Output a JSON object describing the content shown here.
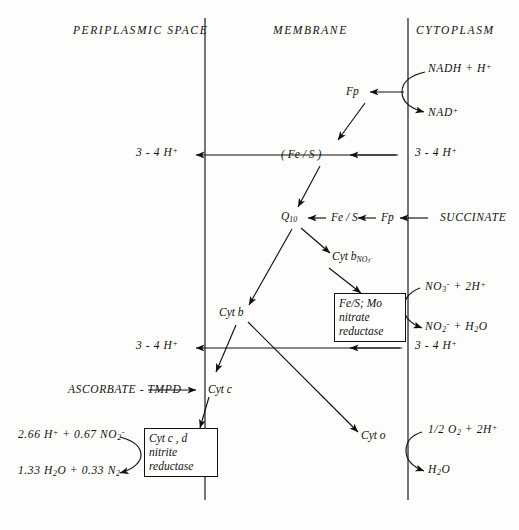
{
  "diagram": {
    "compartments": [
      {
        "name": "periplasmic-space",
        "label": "PERIPLASMIC SPACE"
      },
      {
        "name": "membrane",
        "label": "MEMBRANE"
      },
      {
        "name": "cytoplasm",
        "label": "CYTOPLASM"
      }
    ],
    "membrane_lines": {
      "left_x": 205,
      "right_x": 408,
      "top_y": 18,
      "bottom_y": 500
    },
    "substrates": {
      "nadh": "NADH + H<sup>+</sup>",
      "nad": "NAD<sup>+</sup>",
      "succinate": "SUCCINATE",
      "ascorbate": "ASCORBATE - TMPD"
    },
    "carriers": {
      "fp_nadh": "Fp",
      "fes_paren": "( Fe / S )",
      "q10": "Q<sub>10</sub>",
      "fes_succ": "Fe / S",
      "fp_succ": "Fp",
      "cyt_b_no3": "Cyt b<sub>NO<sub>3</sub><sup>-</sup></sub>",
      "cyt_b": "Cyt b",
      "cyt_c": "Cyt c",
      "cyt_o": "Cyt o"
    },
    "proton_labels": {
      "row1_periplasm": "3 - 4 H<sup>+</sup>",
      "row1_cytoplasm": "3 - 4 H<sup>+</sup>",
      "row2_periplasm": "3 - 4 H<sup>+</sup>",
      "row2_cytoplasm": "3 - 4 H<sup>+</sup>"
    },
    "enzyme_boxes": [
      {
        "name": "nitrate-reductase",
        "lines": [
          "Fe/S; Mo",
          "nitrate",
          "reductase"
        ],
        "substrate_in": "NO<sub>3</sub><sup>-</sup> + 2H<sup>+</sup>",
        "product_out": "NO<sub>2</sub><sup>-</sup> + H<sub>2</sub>O"
      },
      {
        "name": "nitrite-reductase",
        "lines": [
          "Cyt c , d",
          "nitrite",
          "reductase"
        ],
        "substrate_in": "2.66 H<sup>+</sup> + 0.67 NO<sub>2</sub><sup>-</sup>",
        "product_out": "1.33 H<sub>2</sub>O + 0.33 N<sub>2</sub>"
      }
    ],
    "oxidase_reaction": {
      "name": "cytochrome-o-oxidase",
      "substrate_in": "1/2 O<sub>2</sub> + 2H<sup>+</sup>",
      "product_out": "H<sub>2</sub>O"
    },
    "colors": {
      "ink": "#111111",
      "background": "#fdfdfc"
    }
  }
}
